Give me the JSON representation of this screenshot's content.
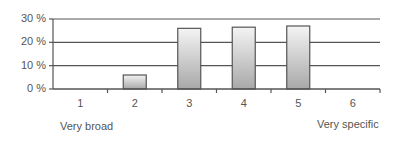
{
  "chart_data": {
    "type": "bar",
    "title": "",
    "xlabel": "",
    "ylabel": "",
    "categories": [
      "1",
      "2",
      "3",
      "4",
      "5",
      "6"
    ],
    "values": [
      0,
      6,
      26,
      26.5,
      27,
      0
    ],
    "ylim": [
      0,
      30
    ],
    "yticks": [
      "0 %",
      "10 %",
      "20 %",
      "30 %"
    ],
    "ytick_values": [
      0,
      10,
      20,
      30
    ],
    "grid": true,
    "legend": null,
    "annotations": {
      "left": "Very broad",
      "right": "Very specific"
    },
    "colors": {
      "bar_top": "#f4f4f4",
      "bar_bottom": "#a8a8a8",
      "bar_border": "#555555",
      "grid": "#555555"
    }
  }
}
